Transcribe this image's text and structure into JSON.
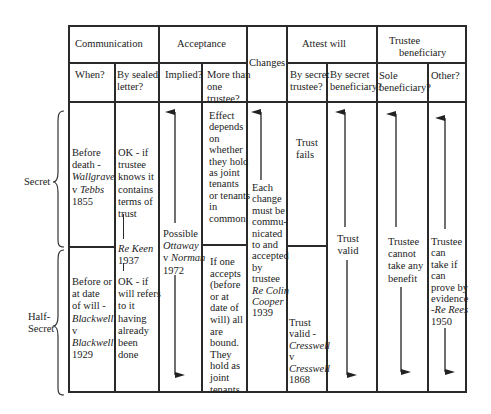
{
  "headers": {
    "communication": "Communication",
    "acceptance": "Acceptance",
    "changes": "Changes",
    "attest_will": "Attest will",
    "trustee_beneficiary": [
      "Trustee",
      "beneficiary"
    ],
    "when": "When?",
    "sealed": [
      "By sealed",
      "letter?"
    ],
    "implied": "Implied?",
    "more_than_one": [
      "More than",
      "one",
      "trustee?"
    ],
    "by_secret_trustee": [
      "By secret",
      "trustee?"
    ],
    "by_secret_beneficiary": [
      "By secret",
      "beneficiary?"
    ],
    "sole_beneficiary": [
      "Sole",
      "beneficiary?"
    ],
    "other": "Other?"
  },
  "row_labels": {
    "secret": "Secret",
    "half_secret": [
      "Half-",
      "Secret"
    ]
  },
  "cells": {
    "secret_when": [
      "Before",
      "death -",
      "Wallgrave",
      "v Tebbs",
      "1855"
    ],
    "secret_sealed": [
      "OK - if",
      "trustee",
      "knows it",
      "contains",
      "terms of",
      "trust"
    ],
    "re_keen": [
      "Re Keen",
      "1937"
    ],
    "implied": [
      "Possible",
      "Ottaway",
      "v Norman",
      "1972"
    ],
    "secret_more": [
      "Effect",
      "depends",
      "on",
      "whether",
      "they hold",
      "as joint",
      "tenants",
      "or tenants",
      "in",
      "common"
    ],
    "changes": [
      "Each",
      "change",
      "must be",
      "commu-",
      "nicated",
      "to and",
      "accepted",
      "by",
      "trustee",
      "Re Colin",
      "Cooper",
      "1939"
    ],
    "secret_attest_trustee": [
      "Trust",
      "fails"
    ],
    "attest_beneficiary": [
      "Trust",
      "valid"
    ],
    "sole": [
      "Trustee",
      "cannot",
      "take any",
      "benefit"
    ],
    "other": [
      "Trustee",
      "can",
      "take if",
      "can",
      "prove by",
      "evidence",
      "-Re Rees",
      "1950"
    ],
    "half_when": [
      "Before or",
      "at date",
      "of will -",
      "Blackwell",
      "v",
      "Blackwell",
      "1929"
    ],
    "half_sealed": [
      "OK - if",
      "will refers",
      "to it",
      "having",
      "already",
      "been",
      "done"
    ],
    "half_more": [
      "If one",
      "accepts",
      "(before",
      "or at",
      "date of",
      "will) all",
      "are",
      "bound.",
      "They",
      "hold as",
      "joint",
      "tenants."
    ],
    "half_attest_trustee": [
      "Trust",
      "valid -",
      "Cresswell",
      "v",
      "Cresswell",
      "1868"
    ]
  }
}
